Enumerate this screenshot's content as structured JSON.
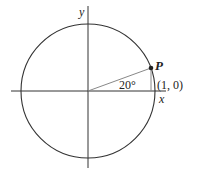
{
  "diagram": {
    "type": "unit-circle",
    "axes": {
      "x_label": "x",
      "y_label": "y"
    },
    "point": {
      "label": "P",
      "angle_deg": 20
    },
    "angle_label": "20°",
    "reference_point_label": "(1, 0)",
    "colors": {
      "circle": "#333333",
      "axes": "#333333",
      "radius_line": "#888888",
      "point": "#222222"
    }
  }
}
